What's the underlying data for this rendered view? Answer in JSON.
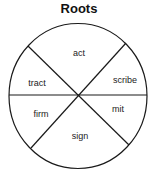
{
  "title": "Roots",
  "diagram": {
    "type": "segmented-circle",
    "center": [
      78,
      96
    ],
    "radius": 70,
    "line_color": "#1a1a1a",
    "segments": [
      {
        "label": "act",
        "x": 79,
        "y": 56
      },
      {
        "label": "tract",
        "x": 37,
        "y": 86
      },
      {
        "label": "scribe",
        "x": 125,
        "y": 83
      },
      {
        "label": "firm",
        "x": 41,
        "y": 117
      },
      {
        "label": "mit",
        "x": 118,
        "y": 112
      },
      {
        "label": "sign",
        "x": 80,
        "y": 139
      }
    ]
  }
}
